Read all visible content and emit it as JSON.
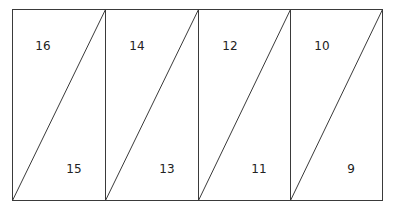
{
  "diagram": {
    "type": "imposition-layout",
    "stroke_color": "#3a3a3a",
    "outer": {
      "left": 12.5,
      "top": 9.5,
      "right": 382.5,
      "bottom": 200.5
    },
    "columns": [
      {
        "x0": 12.5,
        "x1": 105.5,
        "top_label": "16",
        "bottom_label": "15"
      },
      {
        "x0": 105.5,
        "x1": 198.5,
        "top_label": "14",
        "bottom_label": "13"
      },
      {
        "x0": 198.5,
        "x1": 290.5,
        "top_label": "12",
        "bottom_label": "11"
      },
      {
        "x0": 290.5,
        "x1": 382.5,
        "top_label": "10",
        "bottom_label": "9"
      }
    ],
    "labels": {
      "c0_top": "16",
      "c0_bottom": "15",
      "c1_top": "14",
      "c1_bottom": "13",
      "c2_top": "12",
      "c2_bottom": "11",
      "c3_top": "10",
      "c3_bottom": "9"
    }
  }
}
